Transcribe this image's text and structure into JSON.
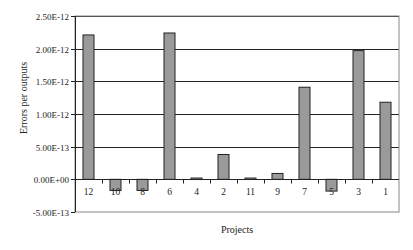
{
  "chart_data": {
    "type": "bar",
    "title": "",
    "xlabel": "Projects",
    "ylabel": "Errors per outputs",
    "categories": [
      "12",
      "10",
      "8",
      "6",
      "4",
      "2",
      "11",
      "9",
      "7",
      "5",
      "3",
      "1"
    ],
    "values": [
      2.21e-12,
      -1.7e-13,
      -1.7e-13,
      2.24e-12,
      2e-14,
      3.8e-13,
      2e-14,
      9e-14,
      1.41e-12,
      -1.8e-13,
      1.97e-12,
      1.18e-12
    ],
    "ylim": [
      -5e-13,
      2.5e-12
    ],
    "yticks": [
      -5e-13,
      0,
      5e-13,
      1e-12,
      1.5e-12,
      2e-12,
      2.5e-12
    ],
    "ytick_labels": [
      "-5.00E-13",
      "0.00E+00",
      "5.00E-13",
      "1.00E-12",
      "1.50E-12",
      "2.00E-12",
      "2.50E-12"
    ],
    "grid": true,
    "legend": null,
    "colors": {
      "bar_fill": "#9a9a9a",
      "bar_stroke": "#222222",
      "grid": "#222222",
      "frame": "#888888"
    }
  }
}
